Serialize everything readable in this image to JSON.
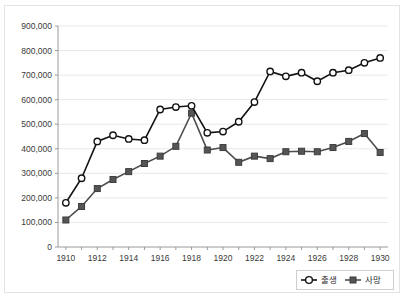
{
  "chart_data": {
    "type": "line",
    "title": "",
    "subtitle": "",
    "xlabel": "",
    "ylabel": "",
    "x": [
      1910,
      1911,
      1912,
      1913,
      1914,
      1915,
      1916,
      1917,
      1918,
      1919,
      1920,
      1921,
      1922,
      1923,
      1924,
      1925,
      1926,
      1927,
      1928,
      1929,
      1930
    ],
    "xlim": [
      1909.5,
      1930.5
    ],
    "ylim": [
      0,
      900000
    ],
    "ytick_values": [
      0,
      100000,
      200000,
      300000,
      400000,
      500000,
      600000,
      700000,
      800000,
      900000
    ],
    "ytick_labels": [
      "0",
      "100,000",
      "200,000",
      "300,000",
      "400,000",
      "500,000",
      "600,000",
      "700,000",
      "800,000",
      "900,000"
    ],
    "xtick_values": [
      1910,
      1912,
      1914,
      1916,
      1918,
      1920,
      1922,
      1924,
      1926,
      1928,
      1930
    ],
    "xtick_labels": [
      "1910",
      "1912",
      "1914",
      "1916",
      "1918",
      "1920",
      "1922",
      "1924",
      "1926",
      "1928",
      "1930"
    ],
    "xtick_minor_every": 1,
    "grid": "horizontal",
    "legend_position": "bottom-right",
    "series": [
      {
        "name": "출생",
        "marker": "circle-open",
        "color": "#121212",
        "values": [
          180000,
          280000,
          430000,
          455000,
          440000,
          435000,
          560000,
          570000,
          575000,
          465000,
          470000,
          510000,
          590000,
          715000,
          695000,
          710000,
          675000,
          710000,
          720000,
          750000,
          770000
        ]
      },
      {
        "name": "사망",
        "marker": "square-filled",
        "color": "#555555",
        "values": [
          110000,
          165000,
          238000,
          275000,
          307000,
          340000,
          370000,
          410000,
          545000,
          395000,
          405000,
          345000,
          370000,
          360000,
          388000,
          390000,
          388000,
          405000,
          430000,
          462000,
          385000
        ]
      }
    ]
  },
  "legend": {
    "items": [
      {
        "label": "출생",
        "marker": "circle-open"
      },
      {
        "label": "사망",
        "marker": "square-filled"
      }
    ]
  },
  "colors": {
    "births": "#121212",
    "deaths": "#555555",
    "grid": "#e8e8e8",
    "axis": "#9a9a9a",
    "frame": "#e3e3e3",
    "text": "#3a3a3a",
    "background": "#ffffff"
  }
}
